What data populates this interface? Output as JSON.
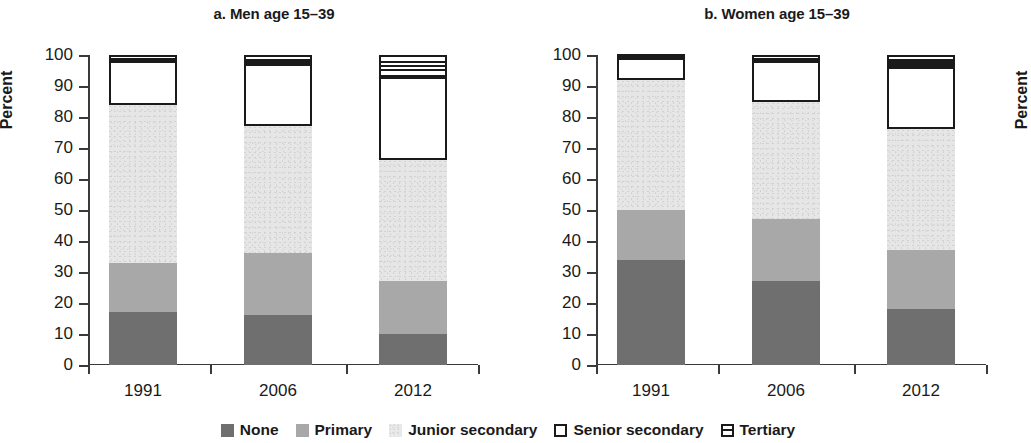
{
  "figure": {
    "ylabel": "Percent"
  },
  "chart_data": [
    {
      "type": "bar",
      "title": "a. Men age 15–39",
      "xlabel": "",
      "ylabel": "Percent",
      "ylim": [
        0,
        100
      ],
      "yticks": [
        0,
        10,
        20,
        30,
        40,
        50,
        60,
        70,
        80,
        90,
        100
      ],
      "ytick_labels": [
        "0",
        "10",
        "20",
        "30",
        "40",
        "50",
        "60",
        "70",
        "80",
        "90",
        "100"
      ],
      "grid": false,
      "stacked": true,
      "categories": [
        "1991",
        "2006",
        "2012"
      ],
      "series": [
        {
          "name": "None",
          "values": [
            17,
            16,
            10
          ]
        },
        {
          "name": "Primary",
          "values": [
            16,
            20,
            17
          ]
        },
        {
          "name": "Junior secondary",
          "values": [
            51,
            41,
            39
          ]
        },
        {
          "name": "Senior secondary",
          "values": [
            14,
            20,
            27
          ]
        },
        {
          "name": "Tertiary",
          "values": [
            2,
            3,
            7
          ]
        }
      ],
      "cumulative_tops": [
        [
          17,
          33,
          84,
          98,
          100
        ],
        [
          16,
          36,
          77,
          97,
          100
        ],
        [
          10,
          27,
          66,
          93,
          100
        ]
      ]
    },
    {
      "type": "bar",
      "title": "b. Women age 15–39",
      "xlabel": "",
      "ylabel": "Percent",
      "ylim": [
        0,
        100
      ],
      "yticks": [
        0,
        10,
        20,
        30,
        40,
        50,
        60,
        70,
        80,
        90,
        100
      ],
      "ytick_labels": [
        "0",
        "10",
        "20",
        "30",
        "40",
        "50",
        "60",
        "70",
        "80",
        "90",
        "100"
      ],
      "grid": false,
      "stacked": true,
      "categories": [
        "1991",
        "2006",
        "2012"
      ],
      "series": [
        {
          "name": "None",
          "values": [
            34,
            27,
            18
          ]
        },
        {
          "name": "Primary",
          "values": [
            16,
            20,
            19
          ]
        },
        {
          "name": "Junior secondary",
          "values": [
            42,
            38,
            39
          ]
        },
        {
          "name": "Senior secondary",
          "values": [
            7,
            13,
            20
          ]
        },
        {
          "name": "Tertiary",
          "values": [
            1,
            2,
            4
          ]
        }
      ],
      "cumulative_tops": [
        [
          34,
          50,
          92,
          99,
          100
        ],
        [
          27,
          47,
          85,
          98,
          100
        ],
        [
          18,
          37,
          76,
          96,
          100
        ]
      ]
    }
  ],
  "legend": {
    "position": "bottom-center",
    "items": [
      {
        "label": "None",
        "color": "#6f6f6f",
        "style": "solid"
      },
      {
        "label": "Primary",
        "color": "#a8a8a8",
        "style": "solid"
      },
      {
        "label": "Junior secondary",
        "color": "#e9e9e9",
        "style": "speckle"
      },
      {
        "label": "Senior secondary",
        "color": "#ffffff",
        "style": "outline"
      },
      {
        "label": "Tertiary",
        "color": "#ffffff",
        "style": "outline-rule"
      }
    ]
  }
}
